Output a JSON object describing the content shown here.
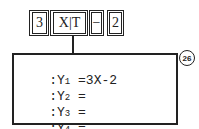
{
  "keys": [
    {
      "label": "3"
    },
    {
      "label": "X|T"
    },
    {
      "label": "−"
    },
    {
      "label": "2"
    }
  ],
  "screen": {
    "lines": [
      {
        "prefix": ":Y",
        "index": "1",
        "rest": " =3X-2"
      },
      {
        "prefix": ":Y",
        "index": "2",
        "rest": " ="
      },
      {
        "prefix": ":Y",
        "index": "3",
        "rest": " ="
      },
      {
        "prefix": ":Y",
        "index": "4",
        "rest": " ="
      }
    ]
  },
  "badge": {
    "label": "26"
  }
}
